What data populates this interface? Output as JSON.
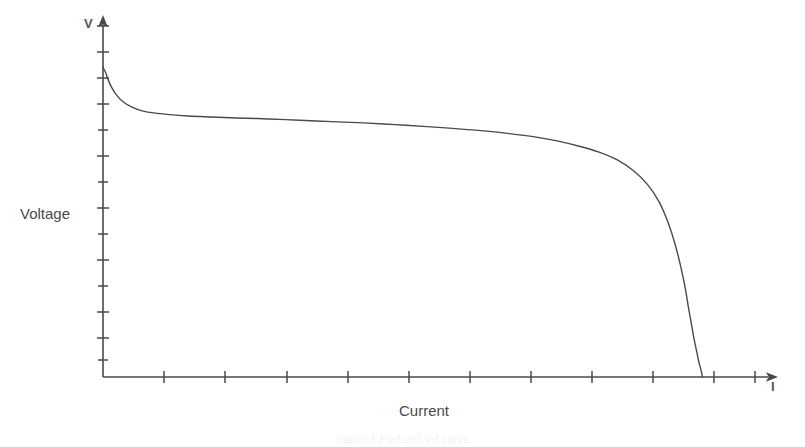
{
  "figure": {
    "background_color": "#ffffff",
    "ink_color": "#4a4a4a",
    "caption": "Figure 1 Fuel cell V-I curve"
  },
  "axes": {
    "y_symbol": "V",
    "x_symbol": "I",
    "y_title": "Voltage",
    "x_title": "Current",
    "y_tick_count": 14,
    "x_tick_count": 11,
    "origin_x_px": 103,
    "origin_y_px": 377,
    "y_axis_top_px": 18,
    "x_axis_right_px": 778
  },
  "chart_data": {
    "type": "line",
    "title": "",
    "subtitle": "",
    "xlabel": "Current",
    "ylabel": "Voltage",
    "x_symbol": "I",
    "y_symbol": "V",
    "xlim": [
      0,
      1.0
    ],
    "ylim": [
      0,
      1.0
    ],
    "grid": false,
    "legend": null,
    "tick_labels": {
      "x": [
        "",
        "",
        "",
        "",
        "",
        "",
        "",
        "",
        "",
        "",
        ""
      ],
      "y": [
        "",
        "",
        "",
        "",
        "",
        "",
        "",
        "",
        "",
        "",
        "",
        "",
        "",
        ""
      ]
    },
    "annotations": [],
    "series": [
      {
        "name": "Polarization curve",
        "color": "#4a4a4a",
        "line_width": 1.4,
        "x": [
          0.0,
          0.004,
          0.008,
          0.014,
          0.022,
          0.032,
          0.045,
          0.06,
          0.08,
          0.105,
          0.135,
          0.17,
          0.21,
          0.26,
          0.31,
          0.36,
          0.41,
          0.46,
          0.51,
          0.555,
          0.6,
          0.64,
          0.68,
          0.715,
          0.75,
          0.78,
          0.81,
          0.835,
          0.858,
          0.876,
          0.89,
          0.901,
          0.91,
          0.917,
          0.922,
          0.927,
          0.931,
          0.935,
          0.938,
          0.941,
          0.943,
          0.944
        ],
        "y": [
          0.93,
          0.915,
          0.893,
          0.868,
          0.845,
          0.826,
          0.811,
          0.8,
          0.793,
          0.788,
          0.784,
          0.781,
          0.778,
          0.775,
          0.771,
          0.767,
          0.763,
          0.758,
          0.752,
          0.746,
          0.739,
          0.731,
          0.721,
          0.709,
          0.693,
          0.676,
          0.652,
          0.62,
          0.577,
          0.525,
          0.463,
          0.398,
          0.33,
          0.266,
          0.208,
          0.156,
          0.112,
          0.076,
          0.048,
          0.026,
          0.01,
          0.0
        ]
      }
    ]
  }
}
